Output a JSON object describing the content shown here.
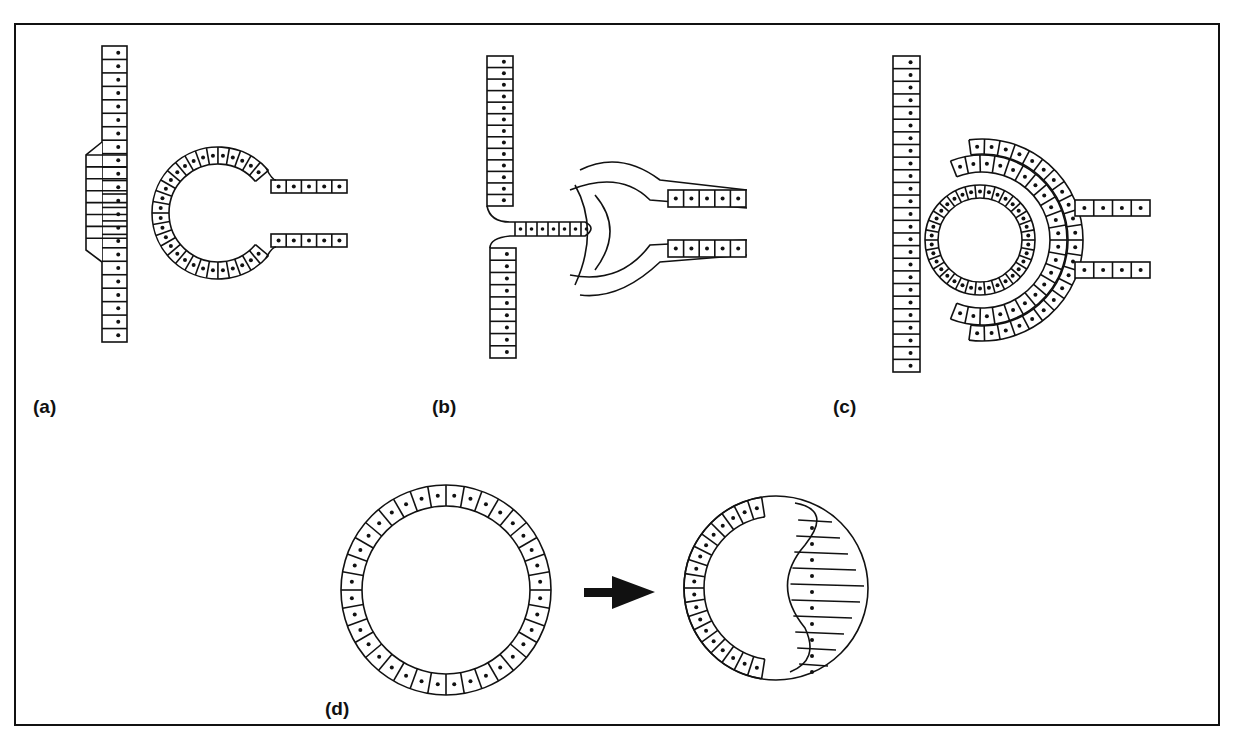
{
  "figure": {
    "panels": [
      {
        "id": "a",
        "label": "(a)",
        "description": "Thickened epithelial placode beside an open vesicle connected to a tube"
      },
      {
        "id": "b",
        "label": "(b)",
        "description": "Epithelial layer invaginating and contacting a folding tube"
      },
      {
        "id": "c",
        "label": "(c)",
        "description": "Closed inner vesicle surrounded by a double-layered cup"
      },
      {
        "id": "d",
        "label": "(d)",
        "description": "Hollow vesicle transforming into a lens-like structure with elongated cells"
      }
    ],
    "arrow": {
      "direction": "right"
    },
    "colors": {
      "line": "#111111",
      "background": "#ffffff",
      "nucleus": "#111111"
    }
  }
}
